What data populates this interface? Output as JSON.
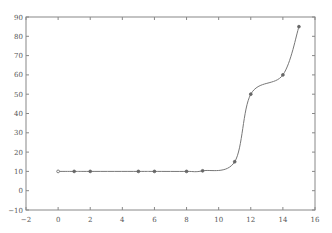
{
  "chart_data": {
    "type": "line",
    "title": "",
    "xlabel": "",
    "ylabel": "",
    "xlim": [
      -2,
      16
    ],
    "ylim": [
      -10,
      90
    ],
    "grid": false,
    "legend": null,
    "x_ticks": [
      "-2",
      "0",
      "2",
      "4",
      "6",
      "8",
      "10",
      "12",
      "14",
      "16"
    ],
    "y_ticks": [
      "-10",
      "0",
      "10",
      "20",
      "30",
      "40",
      "50",
      "60",
      "70",
      "80",
      "90"
    ],
    "series": [
      {
        "name": "data points",
        "style": "markers",
        "x": [
          0,
          1,
          2,
          5,
          6,
          8,
          9,
          11,
          12,
          14,
          15
        ],
        "y": [
          10,
          10,
          10,
          10,
          10,
          10,
          10.3,
          15,
          50,
          60,
          85
        ]
      },
      {
        "name": "interpolating curve",
        "style": "smooth line through points",
        "x": [
          0,
          1,
          2,
          5,
          6,
          8,
          9,
          11,
          12,
          14,
          15
        ],
        "y": [
          10,
          10,
          10,
          10,
          10,
          10,
          10.3,
          15,
          50,
          60,
          85
        ]
      }
    ],
    "colors": {
      "line": "#777777",
      "marker": "#666666",
      "axis": "#888888"
    }
  }
}
